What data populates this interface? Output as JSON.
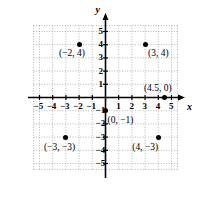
{
  "chart_data": {
    "type": "scatter",
    "title": "",
    "xlabel": "x",
    "ylabel": "y",
    "xlim": [
      -5.5,
      5.5
    ],
    "ylim": [
      -5.5,
      5.5
    ],
    "grid": true,
    "legend": "none",
    "x_ticks": [
      "-5",
      "-4",
      "-3",
      "-2",
      "-1",
      "1",
      "2",
      "3",
      "4",
      "5"
    ],
    "x_tick_values": [
      -5,
      -4,
      -3,
      -2,
      -1,
      1,
      2,
      3,
      4,
      5
    ],
    "y_ticks": [
      "5",
      "4",
      "3",
      "2",
      "1",
      "-1",
      "-2",
      "-3",
      "-4",
      "-5"
    ],
    "y_tick_values": [
      5,
      4,
      3,
      2,
      1,
      -1,
      -2,
      -3,
      -4,
      -5
    ],
    "points": [
      {
        "label": "(-2, 4)",
        "x": -2,
        "y": 4,
        "label_dx": -20,
        "label_dy": 9
      },
      {
        "label": "(3, 4)",
        "x": 3,
        "y": 4,
        "label_dx": 3,
        "label_dy": 9
      },
      {
        "label": "(4.5, 0)",
        "x": 4.5,
        "y": 0,
        "label_dx": -21,
        "label_dy": -9
      },
      {
        "label": "(0, -1)",
        "x": 0,
        "y": -1,
        "label_dx": 2,
        "label_dy": 10
      },
      {
        "label": "(-3, -3)",
        "x": -3,
        "y": -3,
        "label_dx": -22,
        "label_dy": 11
      },
      {
        "label": "(4, -3)",
        "x": 4,
        "y": -3,
        "label_dx": -26,
        "label_dy": 11
      }
    ]
  },
  "colors": {
    "axis": "#000000",
    "grid": "#9a9a9a",
    "point": "#000000",
    "background": "#ffffff"
  },
  "axis_labels": {
    "x": "x",
    "y": "y"
  }
}
